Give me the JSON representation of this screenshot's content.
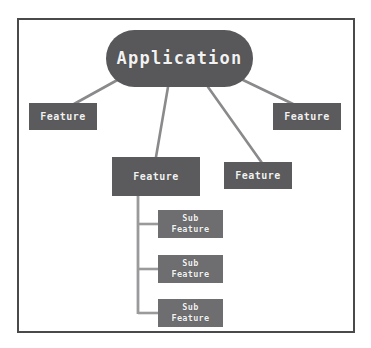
{
  "figure": {
    "background_color": "#ffffff",
    "frame_color": "#4a4a4c"
  },
  "colors": {
    "root_node_fill": "#58585a",
    "feature_node_fill": "#5b5b5d",
    "subfeature_node_fill": "#6e6e71",
    "node_text": "#f2f2f2",
    "connector": "#8a8a8c",
    "branch_line": "#9a9a9c"
  },
  "nodes": {
    "root": {
      "label": "Application",
      "shape": "rounded-rectangle"
    },
    "features": [
      {
        "id": "feature-left",
        "label": "Feature",
        "shape": "rectangle"
      },
      {
        "id": "feature-right",
        "label": "Feature",
        "shape": "rectangle"
      },
      {
        "id": "feature-center",
        "label": "Feature",
        "shape": "rectangle"
      },
      {
        "id": "feature-right-middle",
        "label": "Feature",
        "shape": "rectangle"
      }
    ],
    "sub_features": [
      {
        "id": "sub-feature-1",
        "line1": "Sub",
        "line2": "Feature",
        "shape": "rectangle"
      },
      {
        "id": "sub-feature-2",
        "line1": "Sub",
        "line2": "Feature",
        "shape": "rectangle"
      },
      {
        "id": "sub-feature-3",
        "line1": "Sub",
        "line2": "Feature",
        "shape": "rectangle"
      }
    ]
  },
  "edges": [
    {
      "from": "root",
      "to": "feature-left",
      "style": "diagonal-line"
    },
    {
      "from": "root",
      "to": "feature-center",
      "style": "diagonal-line"
    },
    {
      "from": "root",
      "to": "feature-right-middle",
      "style": "diagonal-line"
    },
    {
      "from": "root",
      "to": "feature-right",
      "style": "diagonal-line"
    },
    {
      "from": "feature-center",
      "to": "sub-feature-1",
      "style": "elbow-trunk"
    },
    {
      "from": "feature-center",
      "to": "sub-feature-2",
      "style": "elbow-trunk"
    },
    {
      "from": "feature-center",
      "to": "sub-feature-3",
      "style": "elbow-trunk"
    }
  ]
}
